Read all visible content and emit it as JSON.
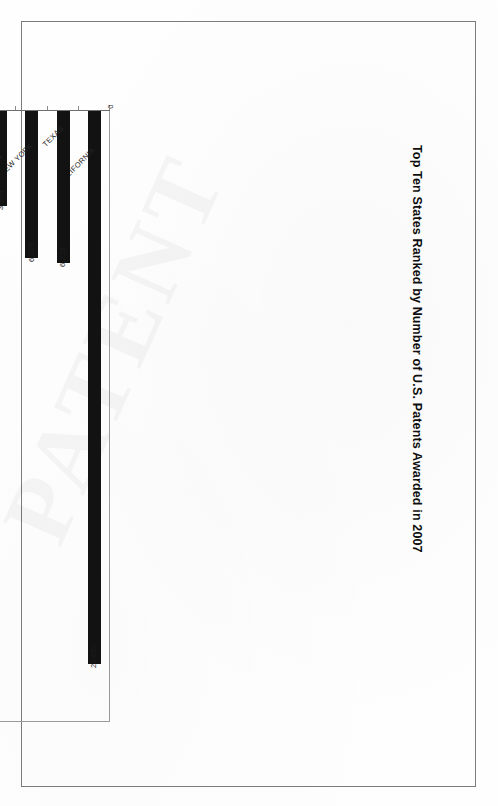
{
  "document": {
    "kind": "scanned-page",
    "watermark_text": "PATENT"
  },
  "chart_data": {
    "type": "bar",
    "orientation": "horizontal",
    "title": "Top Ten States Ranked by Number of U.S. Patents Awarded in 2007",
    "xlabel": "",
    "ylabel": "",
    "xlim": [
      0,
      25000
    ],
    "grid": false,
    "legend": null,
    "value_axis_ticks": [
      "0",
      "5,000",
      "10,000",
      "15,000",
      "20,000",
      "25,000"
    ],
    "value_axis_tick_values": [
      0,
      5000,
      10000,
      15000,
      20000,
      25000
    ],
    "categories": [
      "CALIFORNIA",
      "TEXAS",
      "NEW YORK",
      "WASHINGTON",
      "MASSACHUSETTS",
      "ILLINOIS",
      "MICHIGAN",
      "NEW JERSEY",
      "FLORIDA",
      "OHIO"
    ],
    "values": [
      22601,
      6228,
      6025,
      3894,
      3837,
      3712,
      3696,
      3154,
      3092,
      3062
    ],
    "value_labels": [
      "22,601",
      "6,228",
      "6,025",
      "3,894",
      "3,837",
      "3,712",
      "3,696",
      "3,154",
      "3,092",
      "3,062"
    ],
    "bar_color": "#121212"
  }
}
